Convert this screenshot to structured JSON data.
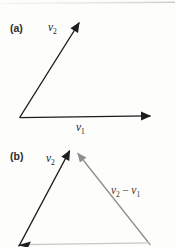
{
  "figure": {
    "type": "vector-diagram",
    "panel_count": 2
  },
  "panel_a": {
    "tag": "(a)",
    "v2_label": {
      "main": "v",
      "sub": "2"
    },
    "v1_label": {
      "main": "v",
      "sub": "1"
    }
  },
  "panel_b": {
    "tag": "(b)",
    "v2_label": {
      "main": "v",
      "sub": "2"
    },
    "diff_label": {
      "m1": "v",
      "s1": "2",
      "op": "−",
      "m2": "v",
      "s2": "1"
    }
  },
  "colors": {
    "ink": "#1d1d1d",
    "vector_gray": "#8e8e8e",
    "baseline_gray": "#c7c7c4",
    "page_edge": "#d6d6d1",
    "background": "#fdfdfc"
  }
}
